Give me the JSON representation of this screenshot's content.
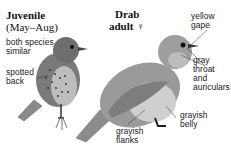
{
  "juvenile": {
    "title": "Juvenile",
    "season": "(May–Aug)",
    "note_line1": "both species",
    "note_line2": "similar",
    "spotted_line1": "spotted",
    "spotted_line2": "back"
  },
  "adult": {
    "title_line1": "Drab",
    "title_line2": "adult ♀",
    "labels": {
      "gape_line1": "yellow",
      "gape_line2": "gape",
      "throat_line1": "gray",
      "throat_line2": "throat",
      "throat_line3": "and",
      "throat_line4": "auriculars",
      "belly_line1": "grayish",
      "belly_line2": "belly",
      "flanks_line1": "grayish",
      "flanks_line2": "flanks"
    }
  }
}
